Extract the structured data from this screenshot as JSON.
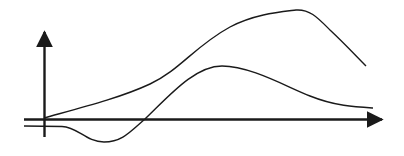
{
  "diagram": {
    "type": "curves-on-axes",
    "labels": [],
    "colors": {
      "background": "#ffffff",
      "stroke": "#1a1a1a"
    },
    "axes": {
      "x_axis": {
        "from": [
          24,
          119
        ],
        "to": [
          384,
          119
        ],
        "arrow": "right"
      },
      "y_axis": {
        "from": [
          44,
          137
        ],
        "to": [
          44,
          30
        ],
        "arrow": "up"
      },
      "baseline_offset": {
        "from": [
          24,
          126
        ],
        "to": [
          65,
          126
        ]
      }
    },
    "curves": [
      {
        "name": "upper-curve",
        "points": [
          [
            44,
            118
          ],
          [
            100,
            102
          ],
          [
            150,
            85
          ],
          [
            200,
            52
          ],
          [
            240,
            24
          ],
          [
            296,
            10
          ],
          [
            330,
            30
          ],
          [
            366,
            66
          ]
        ]
      },
      {
        "name": "lower-curve",
        "points": [
          [
            24,
            126
          ],
          [
            65,
            127
          ],
          [
            104,
            142
          ],
          [
            145,
            119
          ],
          [
            222,
            66
          ],
          [
            300,
            93
          ],
          [
            373,
            108
          ]
        ]
      }
    ]
  }
}
